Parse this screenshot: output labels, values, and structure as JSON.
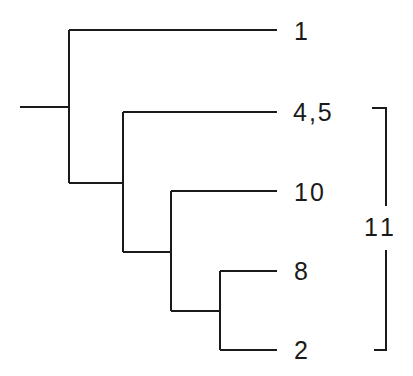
{
  "diagram": {
    "type": "phylogenetic-tree",
    "leaves": [
      {
        "label": "1"
      },
      {
        "label": "4,5"
      },
      {
        "label": "10"
      },
      {
        "label": "8"
      },
      {
        "label": "2"
      }
    ],
    "bracket": {
      "label": "11",
      "spans": [
        "4,5",
        "10",
        "8",
        "2"
      ]
    },
    "colors": {
      "line": "#1a1a1a",
      "background": "#ffffff"
    }
  }
}
